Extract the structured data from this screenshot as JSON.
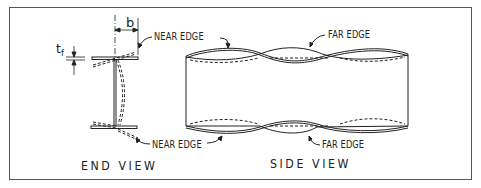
{
  "figure": {
    "end_view": {
      "title": "END VIEW",
      "dimension_b": "b",
      "dimension_tf": "t",
      "dimension_tf_sub": "f",
      "label_top": "NEAR EDGE",
      "label_bottom": "NEAR EDGE"
    },
    "side_view": {
      "title": "SIDE VIEW",
      "label_top": "FAR EDGE",
      "label_bottom": "FAR EDGE"
    },
    "colors": {
      "line": "#222222",
      "border": "#555555",
      "background": "#ffffff"
    }
  }
}
